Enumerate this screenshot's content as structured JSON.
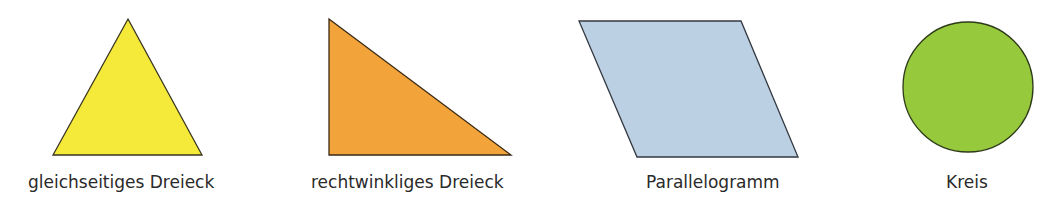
{
  "shapes": [
    {
      "id": "equilateral-triangle",
      "label": "gleichseitiges Dreieck",
      "fill": "#f5ea3a",
      "stroke": "#3a3520",
      "points": "128,19 202,155 53,155"
    },
    {
      "id": "right-triangle",
      "label": "rechtwinkliges Dreieck",
      "fill": "#f2a33a",
      "stroke": "#3a2a15",
      "points": "329,19 511,155 329,155"
    },
    {
      "id": "parallelogram",
      "label": "Parallelogramm",
      "fill": "#bcd0e4",
      "stroke": "#333840",
      "points": "579,21 741,21 798,157 637,157"
    },
    {
      "id": "circle",
      "label": "Kreis",
      "fill": "#97c93d",
      "stroke": "#2d3a18",
      "cx": 968,
      "cy": 87,
      "r": 65
    }
  ]
}
